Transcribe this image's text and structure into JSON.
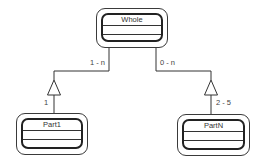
{
  "diagram": {
    "type": "uml-aggregation",
    "classes": [
      {
        "id": "whole",
        "name": "Whole"
      },
      {
        "id": "part1",
        "name": "Part1"
      },
      {
        "id": "partn",
        "name": "PartN"
      }
    ],
    "associations": [
      {
        "from": "whole",
        "to": "part1",
        "whole_multiplicity": "1 - n",
        "part_multiplicity": "1"
      },
      {
        "from": "whole",
        "to": "partn",
        "whole_multiplicity": "0 - n",
        "part_multiplicity": "2 - 5"
      }
    ]
  },
  "colors": {
    "line": "#333333",
    "background": "#ffffff"
  }
}
